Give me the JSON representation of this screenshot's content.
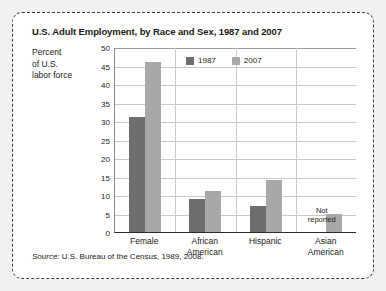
{
  "chart_data": {
    "type": "bar",
    "title": "U.S. Adult Employment, by Race and Sex, 1987 and 2007",
    "ylabel_lines": [
      "Percent",
      "of U.S.",
      "labor force"
    ],
    "xlabel": "",
    "categories": [
      "Female",
      "African American",
      "Hispanic",
      "Asian American"
    ],
    "category_lines": [
      [
        "Female"
      ],
      [
        "African",
        "American"
      ],
      [
        "Hispanic"
      ],
      [
        "Asian",
        "American"
      ]
    ],
    "series": [
      {
        "name": "1987",
        "color": "#6e6e6e",
        "values": [
          31,
          9,
          7,
          null
        ]
      },
      {
        "name": "2007",
        "color": "#a8a8a8",
        "values": [
          46,
          11,
          14,
          5
        ]
      }
    ],
    "ylim": [
      0,
      50
    ],
    "yticks": [
      0,
      5,
      10,
      15,
      20,
      25,
      30,
      35,
      40,
      45,
      50
    ],
    "ytick_labels": [
      "0",
      "5",
      "10",
      "15",
      "20",
      "25",
      "30",
      "35",
      "40",
      "45",
      "50"
    ],
    "grid": true,
    "legend_position": "top-center",
    "annotations": [
      {
        "text_lines": [
          "Not",
          "reported"
        ],
        "category": "Asian American",
        "series": "1987"
      }
    ],
    "source_label": "Source:",
    "source_text": "U.S. Bureau of the Census, 1989, 2008."
  }
}
